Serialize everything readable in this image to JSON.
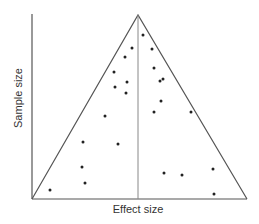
{
  "chart_data": {
    "type": "scatter",
    "subtype": "funnel-plot",
    "title": "",
    "xlabel": "Effect size",
    "ylabel": "Sample size",
    "grid": false,
    "legend": null,
    "axes_pixel": {
      "x0": 32,
      "y_top": 14,
      "y_base": 199,
      "x_right": 247
    },
    "funnel": {
      "apex": [
        138,
        15
      ],
      "left_base": [
        32,
        199
      ],
      "right_base": [
        247,
        199
      ],
      "center_line_x": 138
    },
    "points_pixel": [
      [
        143,
        35
      ],
      [
        132,
        48
      ],
      [
        152,
        49
      ],
      [
        125,
        57
      ],
      [
        154,
        68
      ],
      [
        114,
        72
      ],
      [
        127,
        82
      ],
      [
        163,
        79
      ],
      [
        160,
        81
      ],
      [
        115,
        87
      ],
      [
        126,
        93
      ],
      [
        161,
        101
      ],
      [
        105,
        116
      ],
      [
        154,
        112
      ],
      [
        191,
        112
      ],
      [
        83,
        142
      ],
      [
        118,
        144
      ],
      [
        82,
        167
      ],
      [
        164,
        173
      ],
      [
        182,
        175
      ],
      [
        213,
        169
      ],
      [
        85,
        183
      ],
      [
        50,
        190
      ],
      [
        214,
        194
      ]
    ],
    "colors": {
      "line": "#555555",
      "point": "#222222",
      "text": "#333333"
    }
  },
  "labels": {
    "x_axis": "Effect size",
    "y_axis": "Sample size"
  }
}
